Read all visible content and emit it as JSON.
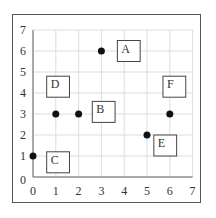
{
  "chart_data": {
    "type": "scatter",
    "title": "",
    "xlabel": "",
    "ylabel": "",
    "xlim": [
      0,
      7
    ],
    "ylim": [
      0,
      7
    ],
    "grid": true,
    "x_ticks": [
      "0",
      "1",
      "2",
      "3",
      "4",
      "5",
      "6",
      "7"
    ],
    "y_ticks": [
      "0",
      "1",
      "2",
      "3",
      "4",
      "5",
      "6",
      "7"
    ],
    "points": [
      {
        "x": 3,
        "y": 6
      },
      {
        "x": 1,
        "y": 3
      },
      {
        "x": 2,
        "y": 3
      },
      {
        "x": 0,
        "y": 1
      },
      {
        "x": 5,
        "y": 2
      },
      {
        "x": 6,
        "y": 3
      }
    ],
    "boxes": [
      {
        "label": "A",
        "x0": 3.7,
        "y0": 5.5,
        "x1": 4.7,
        "y1": 6.5
      },
      {
        "label": "B",
        "x0": 2.6,
        "y0": 2.6,
        "x1": 3.6,
        "y1": 3.6
      },
      {
        "label": "C",
        "x0": 0.6,
        "y0": 0.2,
        "x1": 1.6,
        "y1": 1.2
      },
      {
        "label": "D",
        "x0": 0.6,
        "y0": 3.8,
        "x1": 1.6,
        "y1": 4.8
      },
      {
        "label": "E",
        "x0": 5.3,
        "y0": 1.0,
        "x1": 6.3,
        "y1": 2.0
      },
      {
        "label": "F",
        "x0": 5.7,
        "y0": 3.8,
        "x1": 6.7,
        "y1": 4.8
      }
    ]
  },
  "colors": {
    "grid": "#dddddd",
    "axis": "#666666",
    "point": "#111111",
    "box": "#444444",
    "text": "#333333"
  }
}
